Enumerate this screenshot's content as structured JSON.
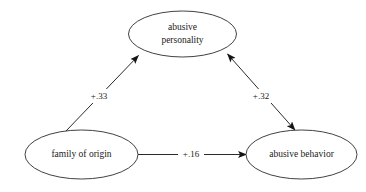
{
  "diagram": {
    "type": "path-model",
    "title": "",
    "background_color": "#ffffff",
    "stroke_color": "#2b2b2b",
    "text_color": "#1a1a1a",
    "nodes": [
      {
        "id": "abusive-personality",
        "label_line1": "abusive",
        "label_line2": "personality",
        "cx": 182.5,
        "cy": 34,
        "rx": 54,
        "ry": 23
      },
      {
        "id": "family-of-origin",
        "label_line1": "family of origin",
        "label_line2": "",
        "cx": 81.5,
        "cy": 154.5,
        "rx": 56.5,
        "ry": 24.5
      },
      {
        "id": "abusive-behavior",
        "label_line1": "abusive behavior",
        "label_line2": "",
        "cx": 301.5,
        "cy": 154.5,
        "rx": 55.5,
        "ry": 24.5
      }
    ],
    "edges": [
      {
        "id": "family-to-personality",
        "from": "family-of-origin",
        "to": "abusive-personality",
        "label": "+.33",
        "label_x": 99,
        "label_y": 96,
        "arrow_start": false,
        "arrow_end": true
      },
      {
        "id": "behavior-personality",
        "from": "abusive-behavior",
        "to": "abusive-personality",
        "label": "+.32",
        "label_x": 261,
        "label_y": 96,
        "arrow_start": true,
        "arrow_end": true
      },
      {
        "id": "family-to-behavior",
        "from": "family-of-origin",
        "to": "abusive-behavior",
        "label": "+.16",
        "label_x": 191,
        "label_y": 154,
        "arrow_start": false,
        "arrow_end": true
      }
    ]
  }
}
